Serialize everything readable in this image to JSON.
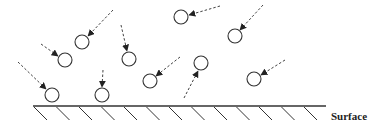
{
  "diagram": {
    "surface_label": "Surface",
    "colors": {
      "stroke": "#333333",
      "background": "#ffffff"
    },
    "particle_radius": 7,
    "particles": [
      {
        "id": "p1",
        "cx": 82,
        "cy": 42,
        "arrow_from": [
          113,
          10
        ],
        "arrow_to": [
          88,
          36
        ]
      },
      {
        "id": "p2",
        "cx": 65,
        "cy": 60,
        "arrow_from": [
          41,
          44
        ],
        "arrow_to": [
          58,
          56
        ]
      },
      {
        "id": "p3",
        "cx": 129,
        "cy": 59,
        "arrow_from": [
          121,
          25
        ],
        "arrow_to": [
          127,
          51
        ]
      },
      {
        "id": "p4",
        "cx": 181,
        "cy": 17,
        "arrow_from": [
          220,
          6
        ],
        "arrow_to": [
          189,
          15
        ]
      },
      {
        "id": "p5",
        "cx": 235,
        "cy": 36,
        "arrow_from": [
          263,
          5
        ],
        "arrow_to": [
          240,
          30
        ]
      },
      {
        "id": "p6",
        "cx": 52,
        "cy": 95,
        "arrow_from": [
          18,
          62
        ],
        "arrow_to": [
          46,
          89
        ]
      },
      {
        "id": "p7",
        "cx": 102,
        "cy": 95,
        "arrow_from": [
          103,
          70
        ],
        "arrow_to": [
          102,
          87
        ]
      },
      {
        "id": "p8",
        "cx": 150,
        "cy": 81,
        "arrow_from": [
          180,
          57
        ],
        "arrow_to": [
          156,
          76
        ]
      },
      {
        "id": "p9",
        "cx": 201,
        "cy": 63,
        "arrow_from": [
          184,
          98
        ],
        "arrow_to": [
          198,
          71
        ]
      },
      {
        "id": "p10",
        "cx": 254,
        "cy": 79,
        "arrow_from": [
          285,
          60
        ],
        "arrow_to": [
          261,
          75
        ]
      }
    ],
    "surface": {
      "x1": 33,
      "x2": 326,
      "y": 106,
      "hatch_count": 13,
      "hatch_spacing": 22.5,
      "hatch_dx": 13,
      "hatch_dy": 14
    }
  }
}
